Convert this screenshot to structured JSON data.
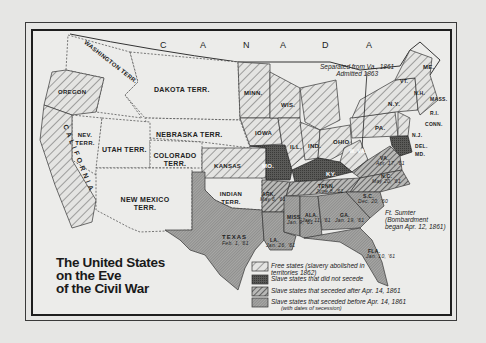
{
  "map": {
    "title_lines": [
      "The United States",
      "on the Eve",
      "of the Civil War"
    ],
    "country_label_letters": [
      "C",
      "A",
      "N",
      "A",
      "D",
      "A"
    ],
    "colors": {
      "background": "#e6e6e4",
      "paper": "#ececea",
      "free_states": "#d8d8d6",
      "slave_no_secede": "#555555",
      "seceded_after": "#8c8c8a",
      "seceded_before": "#a6a6a4",
      "territory": "#ececea",
      "ink": "#1e1e1e"
    },
    "territories": [
      {
        "name": "WASHINGTON TERR."
      },
      {
        "name": "DAKOTA TERR."
      },
      {
        "name": "NEBRASKA TERR."
      },
      {
        "name": "NEV. TERR."
      },
      {
        "name": "UTAH TERR."
      },
      {
        "name": "COLORADO TERR."
      },
      {
        "name": "NEW MEXICO TERR."
      },
      {
        "name": "INDIAN TERR."
      }
    ],
    "free_states": [
      "OREGON",
      "CALIFORNIA",
      "MINN.",
      "IOWA",
      "KANSAS",
      "WIS.",
      "MICH.",
      "ILL.",
      "IND.",
      "OHIO",
      "PA.",
      "N.Y.",
      "VT.",
      "N.H.",
      "ME.",
      "MASS.",
      "R.I.",
      "CONN.",
      "N.J.",
      "W. VA."
    ],
    "slave_states_not_seceded": [
      "MO.",
      "KY.",
      "DEL.",
      "MD."
    ],
    "seceded_after": [
      {
        "name": "VA.",
        "date": "Apr. 17, '61"
      },
      {
        "name": "ARK.",
        "date": "May 6, '61"
      },
      {
        "name": "TENN.",
        "date": "June 8, '61"
      },
      {
        "name": "N.C.",
        "date": "May 20, '61"
      }
    ],
    "seceded_before": [
      {
        "name": "S.C.",
        "date": "Dec. 20, '60"
      },
      {
        "name": "MISS.",
        "date": "Jan. 9, '61"
      },
      {
        "name": "FLA.",
        "date": "Jan. 10, '61"
      },
      {
        "name": "ALA.",
        "date": "Jan. 11, '61"
      },
      {
        "name": "GA.",
        "date": "Jan. 19, '61"
      },
      {
        "name": "LA.",
        "date": "Jan. 26, '61"
      },
      {
        "name": "TEXAS",
        "date": "Feb. 1, '61"
      }
    ],
    "annotations": {
      "west_virginia": [
        "Separated from Va., 1861",
        "Admitted 1863"
      ],
      "fort_sumter": [
        "Ft. Sumter",
        "(Bombardment",
        "began Apr. 12, 1861)"
      ]
    },
    "legend": [
      {
        "key": "free",
        "text": "Free states (slavery abolished in territories 1862)"
      },
      {
        "key": "slave_no_secede",
        "text": "Slave states that did not secede"
      },
      {
        "key": "seceded_after",
        "text": "Slave states that seceded after Apr. 14, 1861"
      },
      {
        "key": "seceded_before",
        "text": "Slave states that seceded before Apr. 14, 1861",
        "subtext": "(with dates of secession)"
      }
    ]
  }
}
